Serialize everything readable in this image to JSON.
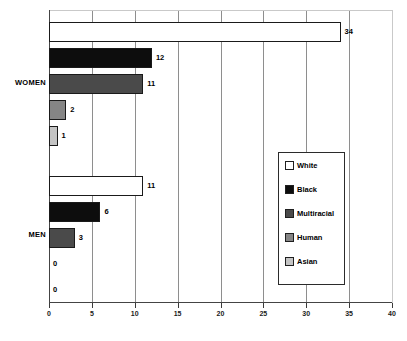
{
  "chart_data": {
    "type": "bar",
    "orientation": "horizontal",
    "title": "",
    "xlabel": "",
    "ylabel": "",
    "xlim": [
      0,
      40
    ],
    "xticks": [
      0,
      5,
      10,
      15,
      20,
      25,
      30,
      35,
      40
    ],
    "grid": true,
    "legend_position": "right-middle",
    "categories": [
      "WOMEN",
      "MEN"
    ],
    "series": [
      {
        "name": "White",
        "color": "#ffffff",
        "values": [
          34,
          11
        ]
      },
      {
        "name": "Black",
        "color": "#0d0d0d",
        "values": [
          12,
          6
        ]
      },
      {
        "name": "Multiracial",
        "color": "#4a4a4a",
        "values": [
          11,
          3
        ]
      },
      {
        "name": "Human",
        "color": "#858585",
        "values": [
          2,
          0
        ]
      },
      {
        "name": "Asian",
        "color": "#c4c4c4",
        "values": [
          1,
          0
        ]
      }
    ],
    "bars": [
      {
        "group": "WOMEN",
        "series": "White",
        "value": 34,
        "label": "34",
        "color": "#ffffff"
      },
      {
        "group": "WOMEN",
        "series": "Black",
        "value": 12,
        "label": "12",
        "color": "#0d0d0d"
      },
      {
        "group": "WOMEN",
        "series": "Multiracial",
        "value": 11,
        "label": "11",
        "color": "#4a4a4a"
      },
      {
        "group": "WOMEN",
        "series": "Human",
        "value": 2,
        "label": "2",
        "color": "#858585"
      },
      {
        "group": "WOMEN",
        "series": "Asian",
        "value": 1,
        "label": "1",
        "color": "#c4c4c4"
      },
      {
        "group": "MEN",
        "series": "White",
        "value": 11,
        "label": "11",
        "color": "#ffffff"
      },
      {
        "group": "MEN",
        "series": "Black",
        "value": 6,
        "label": "6",
        "color": "#0d0d0d"
      },
      {
        "group": "MEN",
        "series": "Multiracial",
        "value": 3,
        "label": "3",
        "color": "#4a4a4a"
      },
      {
        "group": "MEN",
        "series": "Human",
        "value": 0,
        "label": "0",
        "color": "#858585"
      },
      {
        "group": "MEN",
        "series": "Asian",
        "value": 0,
        "label": "0",
        "color": "#c4c4c4"
      }
    ]
  },
  "axis": {
    "tick_labels": [
      "0",
      "5",
      "10",
      "15",
      "20",
      "25",
      "30",
      "35",
      "40"
    ]
  },
  "group_labels": {
    "women": "WOMEN",
    "men": "MEN"
  },
  "legend": {
    "items": [
      {
        "label": "White",
        "color": "#ffffff"
      },
      {
        "label": "Black",
        "color": "#0d0d0d"
      },
      {
        "label": "Multiracial",
        "color": "#4a4a4a"
      },
      {
        "label": "Human",
        "color": "#858585"
      },
      {
        "label": "Asian",
        "color": "#c4c4c4"
      }
    ]
  }
}
